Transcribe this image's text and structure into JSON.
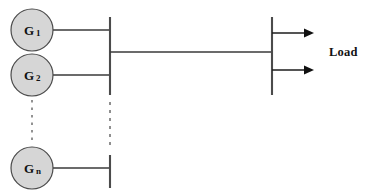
{
  "diagram": {
    "type": "single-line-power-diagram",
    "colors": {
      "generator_fill": "#d6d6d6",
      "generator_stroke": "#4a4a4a",
      "conductor": "#3a3a3a",
      "busbar": "#4b4b4b",
      "arrow": "#111111",
      "dashed": "#8a8a8a",
      "background": "#ffffff"
    },
    "generators": [
      {
        "id": "g1",
        "label": "G",
        "subscript": "1",
        "cx": 32,
        "cy": 30,
        "r": 21
      },
      {
        "id": "g2",
        "label": "G",
        "subscript": "2",
        "cx": 32,
        "cy": 75,
        "r": 21
      },
      {
        "id": "gn",
        "label": "G",
        "subscript": "n",
        "cx": 32,
        "cy": 168,
        "r": 21
      }
    ],
    "buses": [
      {
        "id": "generation-bus",
        "x": 110,
        "y_top": 17,
        "y_bottom": 95,
        "label": ""
      },
      {
        "id": "generation-bus-lower",
        "x": 110,
        "y_top": 155,
        "y_bottom": 188,
        "label": ""
      },
      {
        "id": "load-bus",
        "x": 272,
        "y_top": 17,
        "y_bottom": 95,
        "label": ""
      }
    ],
    "tie_line": {
      "from_x": 110,
      "to_x": 272,
      "y": 52
    },
    "feeders": [
      {
        "id": "feeder-1",
        "from_x": 272,
        "to_x": 312,
        "y": 33
      },
      {
        "id": "feeder-2",
        "from_x": 272,
        "to_x": 312,
        "y": 70
      }
    ],
    "ellipses": [
      {
        "id": "generator-ellipsis",
        "x": 32,
        "y_top": 100,
        "y_bottom": 142
      },
      {
        "id": "bus-ellipsis",
        "x": 110,
        "y_top": 102,
        "y_bottom": 150
      }
    ],
    "labels": {
      "load": "Load"
    }
  }
}
